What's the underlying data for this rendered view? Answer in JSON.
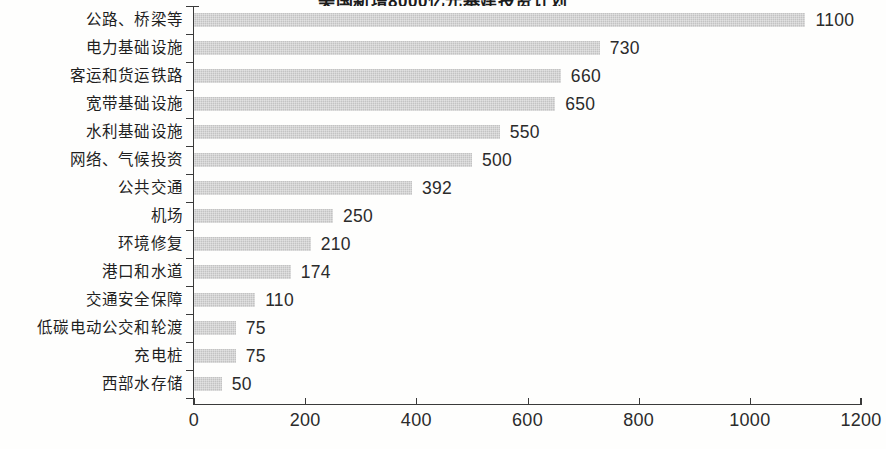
{
  "chart_data": {
    "type": "bar",
    "orientation": "horizontal",
    "title": "美国新增8000亿元基建投资计划",
    "xlabel": "",
    "ylabel": "",
    "xlim": [
      0,
      1200
    ],
    "xticks": [
      0,
      200,
      400,
      600,
      800,
      1000,
      1200
    ],
    "xtick_labels": [
      "0",
      "200",
      "400",
      "600",
      "800",
      "1000",
      "1200"
    ],
    "grid": false,
    "legend": null,
    "bar_color": "#c9c9c9",
    "axis_color": "#3a3a3a",
    "categories": [
      "公路、桥梁等",
      "电力基础设施",
      "客运和货运铁路",
      "宽带基础设施",
      "水利基础设施",
      "网络、气候投资",
      "公共交通",
      "机场",
      "环境修复",
      "港口和水道",
      "交通安全保障",
      "低碳电动公交和轮渡",
      "充电桩",
      "西部水存储"
    ],
    "values": [
      1100,
      730,
      660,
      650,
      550,
      500,
      392,
      250,
      210,
      174,
      110,
      75,
      75,
      50
    ],
    "value_labels": [
      "1100",
      "730",
      "660",
      "650",
      "550",
      "500",
      "392",
      "250",
      "210",
      "174",
      "110",
      "75",
      "75",
      "50"
    ]
  }
}
